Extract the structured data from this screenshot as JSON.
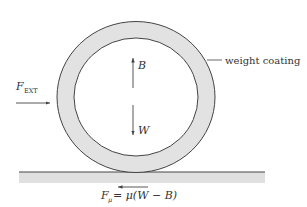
{
  "diagram": {
    "labels": {
      "weight_coating": "weight coating",
      "buoyancy": "B",
      "weight": "W",
      "external_force_main": "F",
      "external_force_sub": "EXT",
      "friction_main": "F",
      "friction_sub": "μ",
      "friction_eq": "= μ(W − B)"
    },
    "colors": {
      "coating_fill": "#e2e2e2",
      "ground_fill": "#e0e0e0",
      "stroke": "#444444",
      "text": "#333333"
    }
  }
}
